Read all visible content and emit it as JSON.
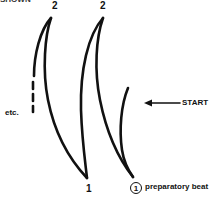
{
  "figure": {
    "top_cut_text": "SHOWN",
    "beat_labels": {
      "beat2_left": "2",
      "beat2_right": "2",
      "beat1": "1",
      "beat1_circled": "1"
    },
    "annotations": {
      "etc": "etc.",
      "start": "START",
      "preparatory": "preparatory beat"
    },
    "colors": {
      "stroke": "#111111",
      "background": "#ffffff"
    }
  }
}
